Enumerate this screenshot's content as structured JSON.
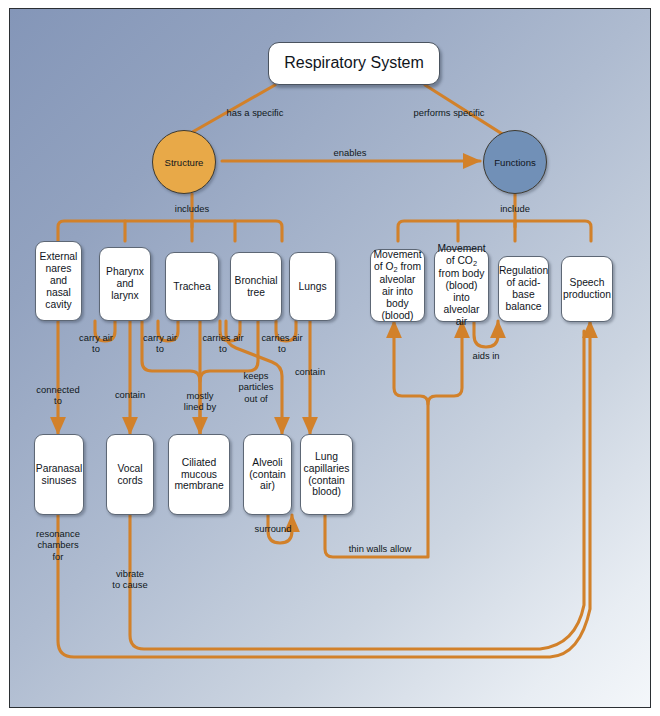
{
  "diagram": {
    "title_node": "Respiratory System",
    "colors": {
      "connector": "#d2812a",
      "structure_circle": "#e8a948",
      "functions_circle": "#7190b7",
      "node_fill": "#ffffff",
      "background_dark": "#8496b8",
      "background_light": "#f4f7fa"
    },
    "hubs": [
      {
        "id": "structure",
        "label": "Structure"
      },
      {
        "id": "functions",
        "label": "Functions"
      }
    ],
    "structure_nodes": [
      {
        "id": "nares",
        "label": "External nares and nasal cavity"
      },
      {
        "id": "pharynx",
        "label": "Pharynx and larynx"
      },
      {
        "id": "trachea",
        "label": "Trachea"
      },
      {
        "id": "bronchial",
        "label": "Bronchial tree"
      },
      {
        "id": "lungs",
        "label": "Lungs"
      }
    ],
    "function_nodes": [
      {
        "id": "o2",
        "label": "Movement of O2 from alveolar air into body (blood)"
      },
      {
        "id": "co2",
        "label": "Movement of CO2 from body (blood) into alveolar air"
      },
      {
        "id": "acidbase",
        "label": "Regulation of acid-base balance"
      },
      {
        "id": "speech",
        "label": "Speech production"
      }
    ],
    "detail_nodes": [
      {
        "id": "sinuses",
        "label": "Paranasal sinuses"
      },
      {
        "id": "vocal",
        "label": "Vocal cords"
      },
      {
        "id": "ciliated",
        "label": "Ciliated mucous membrane"
      },
      {
        "id": "alveoli",
        "label": "Alveoli (contain air)"
      },
      {
        "id": "capillaries",
        "label": "Lung capillaries (contain blood)"
      }
    ],
    "edge_labels": [
      {
        "id": "has-a-specific",
        "text": "has a specific"
      },
      {
        "id": "performs-specific",
        "text": "performs specific"
      },
      {
        "id": "enables",
        "text": "enables"
      },
      {
        "id": "includes",
        "text": "includes"
      },
      {
        "id": "include",
        "text": "include"
      },
      {
        "id": "carry-air-to-1",
        "text": "carry air\nto"
      },
      {
        "id": "carry-air-to-2",
        "text": "carry air\nto"
      },
      {
        "id": "carries-air-to-1",
        "text": "carries air\nto"
      },
      {
        "id": "carries-air-to-2",
        "text": "carries air\nto"
      },
      {
        "id": "connected-to",
        "text": "connected\nto"
      },
      {
        "id": "contain-1",
        "text": "contain"
      },
      {
        "id": "mostly-lined-by",
        "text": "mostly\nlined by"
      },
      {
        "id": "keeps-particles-out-of",
        "text": "keeps\nparticles\nout of"
      },
      {
        "id": "contain-2",
        "text": "contain"
      },
      {
        "id": "surround",
        "text": "surround"
      },
      {
        "id": "thin-walls-allow",
        "text": "thin walls allow"
      },
      {
        "id": "aids-in",
        "text": "aids in"
      },
      {
        "id": "resonance-chambers-for",
        "text": "resonance\nchambers\nfor"
      },
      {
        "id": "vibrate-to-cause",
        "text": "vibrate\nto cause"
      }
    ]
  }
}
